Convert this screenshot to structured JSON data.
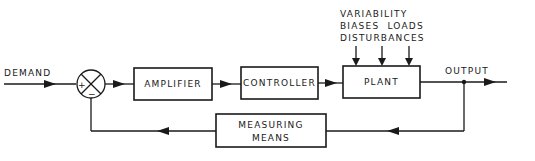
{
  "diagram": {
    "type": "block-diagram",
    "input_label": "DEMAND",
    "output_label": "OUTPUT",
    "summing_junction": {
      "plus_sign": "+",
      "minus_sign": "−"
    },
    "blocks": {
      "amplifier": "AMPLIFIER",
      "controller": "CONTROLLER",
      "plant": "PLANT",
      "measuring_line1": "MEASURING",
      "measuring_line2": "MEANS"
    },
    "plant_inputs": {
      "line1": "VARIABILITY",
      "line2": "BIASES  LOADS",
      "line3": "DISTURBANCES"
    },
    "colors": {
      "stroke": "#1a1a1a",
      "background": "#ffffff"
    }
  }
}
